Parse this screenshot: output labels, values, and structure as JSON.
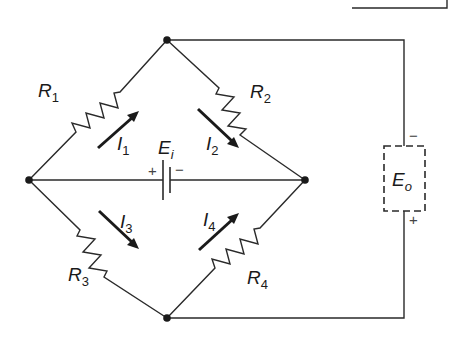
{
  "diagram": {
    "colors": {
      "line": "#2a2a2a",
      "background": "#ffffff"
    },
    "nodes": {
      "top": {
        "x": 167,
        "y": 40
      },
      "left": {
        "x": 29,
        "y": 180
      },
      "right": {
        "x": 305,
        "y": 180
      },
      "bottom": {
        "x": 167,
        "y": 318
      }
    },
    "resistors": [
      {
        "name": "R",
        "sub": "1",
        "between": [
          "left",
          "top"
        ]
      },
      {
        "name": "R",
        "sub": "2",
        "between": [
          "top",
          "right"
        ]
      },
      {
        "name": "R",
        "sub": "3",
        "between": [
          "left",
          "bottom"
        ]
      },
      {
        "name": "R",
        "sub": "4",
        "between": [
          "bottom",
          "right"
        ]
      }
    ],
    "currents": [
      {
        "name": "I",
        "sub": "1",
        "direction": "toward top node"
      },
      {
        "name": "I",
        "sub": "2",
        "direction": "toward right node"
      },
      {
        "name": "I",
        "sub": "3",
        "direction": "toward bottom node"
      },
      {
        "name": "I",
        "sub": "4",
        "direction": "toward right node"
      }
    ],
    "source": {
      "name": "E",
      "sub": "i",
      "plus": "+",
      "minus": "−",
      "between": [
        "left",
        "right"
      ]
    },
    "output": {
      "name": "E",
      "sub": "o",
      "top_sign": "−",
      "bottom_sign": "+",
      "style": "dashed box"
    }
  }
}
